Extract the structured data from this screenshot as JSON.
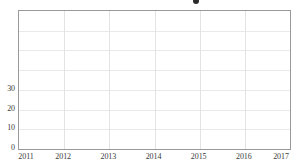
{
  "chart_data": {
    "type": "line",
    "title": "",
    "title_visible": false,
    "title_note": "title is cropped off above the top edge of the screenshot; only a dark round marker glyph is partially visible",
    "xlabel": "",
    "ylabel": "",
    "x": [
      2011,
      2012,
      2013,
      2014,
      2015,
      2016,
      2017
    ],
    "xtick_labels": [
      "2011",
      "2012",
      "2013",
      "2014",
      "2015",
      "2016",
      "2017"
    ],
    "xlim": [
      2011,
      2017
    ],
    "ytick_labels": [
      "0",
      "10",
      "20",
      "30"
    ],
    "ytick_values": [
      0,
      10,
      20,
      30
    ],
    "ygrid_values": [
      0,
      10,
      20,
      30,
      40,
      50,
      60,
      70
    ],
    "ylim": [
      0,
      70
    ],
    "series": [],
    "grid": true,
    "legend": null,
    "annotations": [],
    "colors": {
      "background": "#ffffff",
      "plot_background": "#ffffff",
      "frame": "#9a9a9a",
      "gridline_horizontal": "#e9e9e9",
      "gridline_vertical": "#e3e3e3",
      "tick_label": "#3c3c3c",
      "title_marker": "#2b2b2b"
    }
  },
  "icons": {
    "title_marker": "filled-circle-marker"
  }
}
